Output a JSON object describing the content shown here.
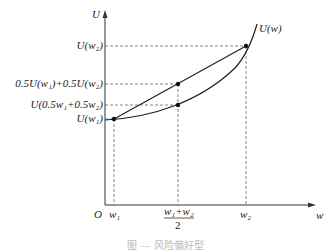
{
  "diagram": {
    "axes": {
      "y_label": "U",
      "x_label": "w",
      "origin_label": "O"
    },
    "curve_label": "U(w)",
    "y_ticks": [
      {
        "label": "U(w₂)",
        "y": 46
      },
      {
        "label": "0.5U(w₁)+0.5U(w₂)",
        "y": 84
      },
      {
        "label": "U(0.5w₁+0.5w₂)",
        "y": 105
      },
      {
        "label": "U(w₁)",
        "y": 119
      }
    ],
    "x_ticks": [
      {
        "label": "w₁",
        "x": 114
      },
      {
        "label_num": "w₁+w₂",
        "label_den": "2",
        "x": 178
      },
      {
        "label": "w₂",
        "x": 246
      }
    ],
    "points": [
      {
        "name": "A",
        "x": 114,
        "y": 119
      },
      {
        "name": "chord-mid",
        "x": 178,
        "y": 84
      },
      {
        "name": "curve-mid",
        "x": 178,
        "y": 105
      },
      {
        "name": "B",
        "x": 246,
        "y": 46
      }
    ]
  },
  "caption": "图 — 风险偏好型"
}
